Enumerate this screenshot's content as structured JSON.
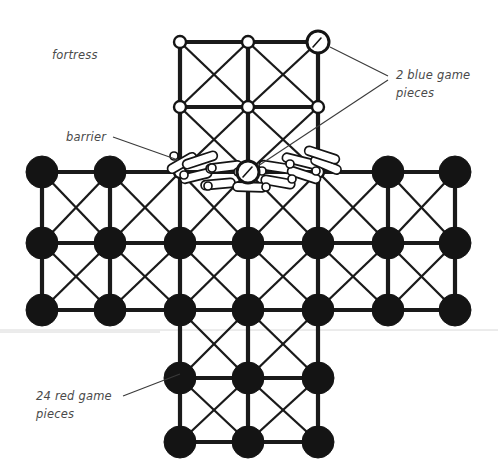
{
  "figure": {
    "background_color": "#ffffff",
    "ink_color": "#141414",
    "label_color": "#4a4a4a"
  },
  "annotations": [
    {
      "id": "fortress",
      "text": "fortress",
      "x": 52,
      "y": 59,
      "has_leader": false
    },
    {
      "id": "barrier",
      "text": "barrier",
      "x": 66,
      "y": 141,
      "has_leader": true
    },
    {
      "id": "blue-pieces",
      "text_line_1": "2 blue game",
      "text_line_2": "pieces",
      "x": 396,
      "y": 79,
      "has_leader": true
    },
    {
      "id": "red-pieces",
      "text_line_1": "24 red game",
      "text_line_2": "pieces",
      "x": 36,
      "y": 400,
      "has_leader": true
    }
  ],
  "geometry": {
    "columns_x": [
      42,
      110,
      180,
      248,
      318,
      388,
      455
    ],
    "rows_y": [
      42,
      107,
      172,
      243,
      310,
      378,
      442
    ],
    "red_node_radius": 16,
    "open_node_radius": 6,
    "blue_node_radius": 11
  },
  "pieces": {
    "red": {
      "count": 24,
      "color": "#141414",
      "style": "filled-disc",
      "label": "24 red game pieces"
    },
    "blue": {
      "count": 2,
      "color": "#ffffff",
      "style": "open-circle",
      "label": "2 blue game pieces",
      "positions": [
        {
          "col": 4,
          "row": 0
        },
        {
          "col": 3,
          "row": 2
        }
      ]
    }
  },
  "fortress": {
    "label": "fortress",
    "description": "3x3 upper grid of open points with diagonals",
    "cols": [
      2,
      3,
      4
    ],
    "rows": [
      0,
      1,
      2
    ]
  },
  "barrier": {
    "label": "barrier",
    "description": "chain of interlocking links arcing across the river row",
    "link_count": 12,
    "row": 2
  },
  "board": {
    "shape": "cross",
    "red_nodes": [
      {
        "col": 0,
        "row": 2
      },
      {
        "col": 1,
        "row": 2
      },
      {
        "col": 5,
        "row": 2
      },
      {
        "col": 6,
        "row": 2
      },
      {
        "col": 0,
        "row": 3
      },
      {
        "col": 1,
        "row": 3
      },
      {
        "col": 2,
        "row": 3
      },
      {
        "col": 3,
        "row": 3
      },
      {
        "col": 4,
        "row": 3
      },
      {
        "col": 5,
        "row": 3
      },
      {
        "col": 6,
        "row": 3
      },
      {
        "col": 0,
        "row": 4
      },
      {
        "col": 1,
        "row": 4
      },
      {
        "col": 2,
        "row": 4
      },
      {
        "col": 3,
        "row": 4
      },
      {
        "col": 4,
        "row": 4
      },
      {
        "col": 5,
        "row": 4
      },
      {
        "col": 6,
        "row": 4
      },
      {
        "col": 2,
        "row": 5
      },
      {
        "col": 3,
        "row": 5
      },
      {
        "col": 4,
        "row": 5
      },
      {
        "col": 2,
        "row": 6
      },
      {
        "col": 3,
        "row": 6
      },
      {
        "col": 4,
        "row": 6
      }
    ],
    "open_nodes": [
      {
        "col": 2,
        "row": 0
      },
      {
        "col": 3,
        "row": 0
      },
      {
        "col": 2,
        "row": 1
      },
      {
        "col": 3,
        "row": 1
      },
      {
        "col": 4,
        "row": 1
      },
      {
        "col": 2,
        "row": 2
      },
      {
        "col": 4,
        "row": 2
      }
    ]
  }
}
